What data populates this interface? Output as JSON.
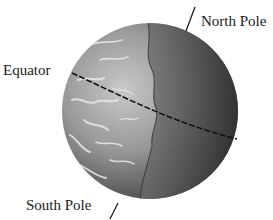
{
  "figure": {
    "labels": {
      "north_pole": "North Pole",
      "equator": "Equator",
      "south_pole": "South Pole"
    },
    "colors": {
      "background": "#ffffff",
      "text": "#1a1a1a",
      "pointer_line": "#1a1a1a",
      "equator_line": "#111111",
      "globe_light": "#c8c8c8",
      "globe_mid": "#8a8a8a",
      "globe_dark": "#2e2e2e"
    }
  }
}
